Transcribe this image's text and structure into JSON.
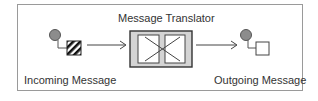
{
  "diagram": {
    "title": "Message Translator",
    "incoming_label": "Incoming Message",
    "outgoing_label": "Outgoing Message",
    "colors": {
      "frame": "#9a9a9a",
      "node_fill": "#8c8c8c",
      "node_stroke": "#555555",
      "translator_fill": "#d4d4d4",
      "line": "#444444"
    }
  }
}
